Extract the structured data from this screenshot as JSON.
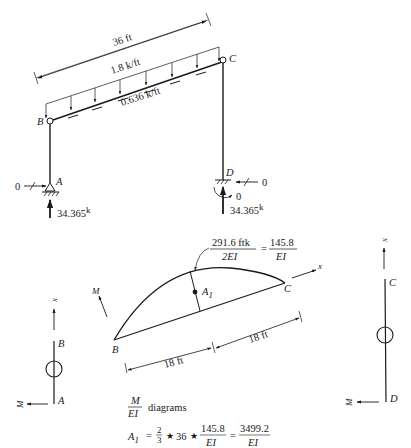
{
  "frame": {
    "span_label": "36 ft",
    "distributed_load_label": "1.8 k/ft",
    "axial_load_label": "0.636 k/ft",
    "nodes": {
      "A": "A",
      "B": "B",
      "C": "C",
      "D": "D"
    },
    "support_A": {
      "horizontal_reaction": "0",
      "vertical_reaction": "34.365",
      "unit": "k"
    },
    "support_D": {
      "horizontal_reaction": "0",
      "moment_reaction": "0",
      "vertical_reaction": "34.365",
      "unit": "k"
    }
  },
  "moment_diagram": {
    "peak_label_num": "291.6 ftk",
    "peak_label_den": "2EI",
    "peak_eq": "=",
    "peak_value_num": "145.8",
    "peak_value_den": "EI",
    "area_label": "A",
    "area_sub": "1",
    "axis_x": "x",
    "axis_m": "M",
    "node_left": "B",
    "node_right": "C",
    "half_span_left": "18 ft",
    "half_span_right": "18 ft"
  },
  "column_AB": {
    "axis_x": "x",
    "axis_m": "M",
    "top": "B",
    "bottom": "A"
  },
  "column_CD": {
    "axis_x": "x",
    "axis_m": "M",
    "top": "C",
    "bottom": "D"
  },
  "caption": {
    "frac_num": "M",
    "frac_den": "EI",
    "text": "diagrams"
  },
  "formula": {
    "lhs": "A",
    "lhs_sub": "1",
    "eq": "=",
    "frac1_num": "2",
    "frac1_den": "3",
    "star1": "★",
    "span": "36",
    "star2": "★",
    "frac2_num": "145.8",
    "frac2_den": "EI",
    "eq2": "=",
    "result_num": "3499.2",
    "result_den": "EI"
  }
}
